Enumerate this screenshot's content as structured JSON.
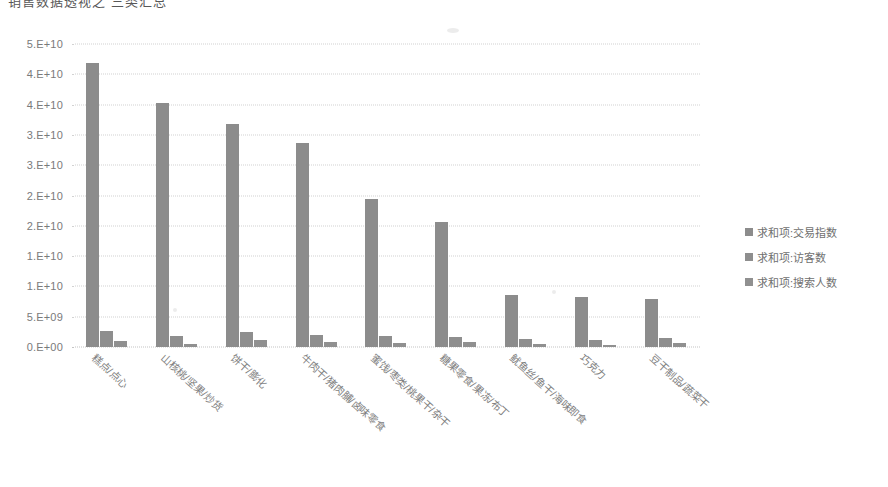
{
  "chart_title": "销售数据透视之  三类汇总",
  "colors": {
    "bar_series_1": "#8c8c8c",
    "bar_series_2": "#8e8e8e",
    "bar_series_3": "#909090",
    "gridline": "#d2d2d2",
    "tick_label": "#7a7a7a",
    "legend_label": "#707070",
    "background": "#ffffff"
  },
  "chart_data": {
    "type": "bar",
    "title": "销售数据透视之  三类汇总",
    "xlabel": "",
    "ylabel": "",
    "ylim": [
      0,
      50000000000
    ],
    "grid": true,
    "legend_position": "right",
    "ytick_labels": [
      "5.E+10",
      "4.E+10",
      "4.E+10",
      "3.E+10",
      "3.E+10",
      "2.E+10",
      "2.E+10",
      "1.E+10",
      "5.E+09",
      "0.E+00"
    ],
    "ytick_values": [
      50000000000,
      45000000000,
      40000000000,
      35000000000,
      30000000000,
      25000000000,
      20000000000,
      15000000000,
      10000000000,
      5000000000,
      0
    ],
    "categories": [
      "糕点/点心",
      "山核桃/坚果/炒货",
      "饼干/膨化",
      "牛肉干/猪肉脯/卤味零食",
      "蜜饯/枣类/桃果干/杂干",
      "糖果零食/果冻/布丁",
      "鱿鱼丝/鱼干/海味即食",
      "巧克力",
      "豆干制品/蔬菜干"
    ],
    "series": [
      {
        "name": "求和项:交易指数",
        "values": [
          46800000000,
          40200000000,
          36800000000,
          33600000000,
          24400000000,
          20600000000,
          8600000000,
          8200000000,
          8000000000
        ]
      },
      {
        "name": "求和项:访客数",
        "values": [
          2600000000,
          1800000000,
          2500000000,
          2000000000,
          1800000000,
          1600000000,
          1300000000,
          1100000000,
          1500000000
        ]
      },
      {
        "name": "求和项:搜索人数",
        "values": [
          1000000000,
          500000000,
          1100000000,
          800000000,
          700000000,
          800000000,
          500000000,
          400000000,
          600000000
        ]
      }
    ]
  },
  "legend": {
    "items": [
      {
        "label": "求和项:交易指数"
      },
      {
        "label": "求和项:访客数"
      },
      {
        "label": "求和项:搜索人数"
      }
    ]
  }
}
